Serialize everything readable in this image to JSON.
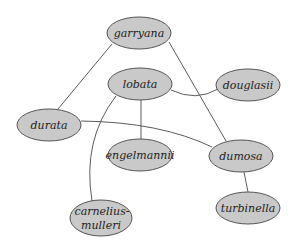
{
  "diagram": {
    "type": "network-graph",
    "node_fill": "#c9c9c9",
    "node_stroke": "#555555",
    "edge_color": "#4a4a4a",
    "nodes": [
      {
        "id": "garryana",
        "label": "garryana",
        "cx": 139,
        "cy": 33,
        "rx": 32,
        "ry": 16
      },
      {
        "id": "lobata",
        "label": "lobata",
        "cx": 140,
        "cy": 84,
        "rx": 32,
        "ry": 16
      },
      {
        "id": "douglasii",
        "label": "douglasii",
        "cx": 248,
        "cy": 85,
        "rx": 32,
        "ry": 16
      },
      {
        "id": "durata",
        "label": "durata",
        "cx": 49,
        "cy": 125,
        "rx": 32,
        "ry": 16
      },
      {
        "id": "engelmannii",
        "label": "engelmannii",
        "cx": 140,
        "cy": 155,
        "rx": 32,
        "ry": 16
      },
      {
        "id": "dumosa",
        "label": "dumosa",
        "cx": 241,
        "cy": 156,
        "rx": 32,
        "ry": 16
      },
      {
        "id": "turbinella",
        "label": "turbinella",
        "cx": 248,
        "cy": 208,
        "rx": 32,
        "ry": 16
      },
      {
        "id": "carnelius-mulleri",
        "label_line1": "carnelius-",
        "label_line2": "mulleri",
        "cx": 101,
        "cy": 218,
        "rx": 31,
        "ry": 18
      }
    ],
    "edges": [
      {
        "from": "garryana",
        "to": "durata"
      },
      {
        "from": "garryana",
        "to": "dumosa"
      },
      {
        "from": "lobata",
        "to": "douglasii"
      },
      {
        "from": "lobata",
        "to": "engelmannii"
      },
      {
        "from": "lobata",
        "to": "carnelius-mulleri"
      },
      {
        "from": "durata",
        "to": "dumosa"
      },
      {
        "from": "dumosa",
        "to": "turbinella"
      }
    ]
  }
}
